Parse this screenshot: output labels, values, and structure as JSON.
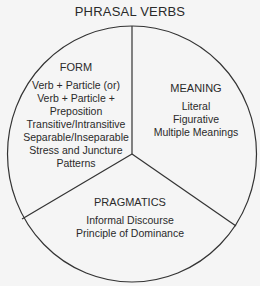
{
  "title": "PHRASAL VERBS",
  "sections": {
    "form": {
      "heading": "FORM",
      "items": [
        "Verb + Particle (or)",
        "Verb + Particle +",
        "Preposition",
        "Transitive/Intransitive",
        "Separable/Inseparable",
        "Stress and Juncture",
        "Patterns"
      ]
    },
    "meaning": {
      "heading": "MEANING",
      "items": [
        "Literal",
        "Figurative",
        "Multiple Meanings"
      ]
    },
    "pragmatics": {
      "heading": "PRAGMATICS",
      "items": [
        "Informal Discourse",
        "Principle of Dominance"
      ]
    }
  },
  "colors": {
    "line": "#333333",
    "background": "#f5f5f5",
    "text": "#2a2a2a"
  }
}
